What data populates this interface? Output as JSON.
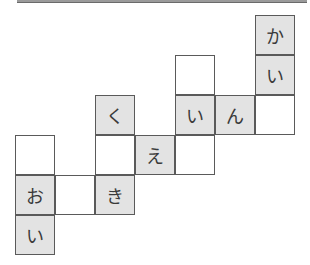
{
  "puzzle": {
    "columns": 7,
    "rows": 6,
    "filled_color": "#e3e3e3",
    "empty_color": "#ffffff",
    "cells": [
      {
        "row": 0,
        "col": 6,
        "char": "か",
        "filled": true
      },
      {
        "row": 1,
        "col": 4,
        "char": "",
        "filled": false
      },
      {
        "row": 1,
        "col": 6,
        "char": "い",
        "filled": true
      },
      {
        "row": 2,
        "col": 2,
        "char": "く",
        "filled": true
      },
      {
        "row": 2,
        "col": 4,
        "char": "い",
        "filled": true
      },
      {
        "row": 2,
        "col": 5,
        "char": "ん",
        "filled": true
      },
      {
        "row": 2,
        "col": 6,
        "char": "",
        "filled": false
      },
      {
        "row": 3,
        "col": 0,
        "char": "",
        "filled": false
      },
      {
        "row": 3,
        "col": 2,
        "char": "",
        "filled": false
      },
      {
        "row": 3,
        "col": 3,
        "char": "え",
        "filled": true
      },
      {
        "row": 3,
        "col": 4,
        "char": "",
        "filled": false
      },
      {
        "row": 4,
        "col": 0,
        "char": "お",
        "filled": true
      },
      {
        "row": 4,
        "col": 1,
        "char": "",
        "filled": false
      },
      {
        "row": 4,
        "col": 2,
        "char": "き",
        "filled": true
      },
      {
        "row": 5,
        "col": 0,
        "char": "い",
        "filled": true
      }
    ]
  }
}
